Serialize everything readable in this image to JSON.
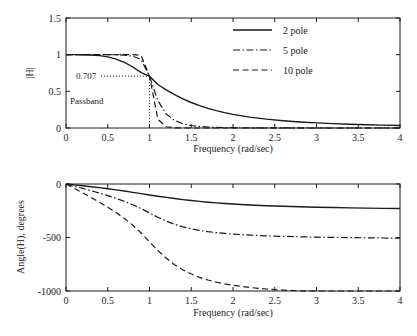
{
  "figure": {
    "background": "#ffffff",
    "ink": "#1a1a1a"
  },
  "legend": {
    "position": "top-right-of-magnitude-plot",
    "entries": [
      {
        "label": "2 pole",
        "style": "solid"
      },
      {
        "label": "5 pole",
        "style": "dash-dot"
      },
      {
        "label": "10 pole",
        "style": "dashed"
      }
    ]
  },
  "annotations": {
    "cutoff_value": "0.707",
    "passband": "Passband"
  },
  "chart_data": [
    {
      "type": "line",
      "title": "",
      "xlabel": "Frequency (rad/sec)",
      "ylabel": "|H|",
      "xlim": [
        0,
        4
      ],
      "ylim": [
        0,
        1.5
      ],
      "xticks": [
        "0",
        "0.5",
        "1",
        "1.5",
        "2",
        "2.5",
        "3",
        "3.5",
        "4"
      ],
      "xtickvals": [
        0,
        0.5,
        1,
        1.5,
        2,
        2.5,
        3,
        3.5,
        4
      ],
      "yticks": [
        "0",
        "0.5",
        "1",
        "1.5"
      ],
      "ytickvals": [
        0,
        0.5,
        1,
        1.5
      ],
      "grid": false,
      "legend_position": "upper right",
      "annotations": [
        {
          "text": "0.707",
          "x": 0.55,
          "y": 0.707,
          "guide": "dotted-horizontal-to-x1"
        },
        {
          "text": "Passband",
          "x": 0.18,
          "y": 0.27
        },
        {
          "guide": "dotted-vertical",
          "x": 1,
          "y0": 0,
          "y1": 0.707
        }
      ],
      "x": [
        0,
        0.1,
        0.2,
        0.3,
        0.4,
        0.5,
        0.6,
        0.7,
        0.8,
        0.9,
        1.0,
        1.1,
        1.2,
        1.3,
        1.4,
        1.5,
        1.6,
        1.7,
        1.8,
        1.9,
        2.0,
        2.2,
        2.4,
        2.6,
        2.8,
        3.0,
        3.2,
        3.4,
        3.6,
        3.8,
        4.0
      ],
      "series": [
        {
          "name": "2 pole",
          "style": "solid",
          "values": [
            1.0,
            0.99995,
            0.9992,
            0.99596,
            0.98744,
            0.9701,
            0.94011,
            0.89433,
            0.8319,
            0.75511,
            0.70711,
            0.59275,
            0.52052,
            0.45507,
            0.39749,
            0.34763,
            0.30477,
            0.26806,
            0.2366,
            0.20959,
            0.1864,
            0.14899,
            0.12083,
            0.09934,
            0.08272,
            0.06969,
            0.05935,
            0.05103,
            0.04428,
            0.03873,
            0.03413
          ]
        },
        {
          "name": "5 pole",
          "style": "dash-dot",
          "values": [
            1.0,
            1.0,
            1.0,
            1.0,
            0.99999,
            0.99984,
            0.99883,
            0.99428,
            0.9777,
            0.93359,
            0.70711,
            0.37419,
            0.19202,
            0.10245,
            0.05753,
            0.03401,
            0.02104,
            0.01354,
            0.009,
            0.00615,
            0.00431,
            0.00226,
            0.00127,
            0.00076,
            0.00047,
            0.00031,
            0.00021,
            0.00014,
            0.0001,
            7e-05,
            5e-05
          ]
        },
        {
          "name": "10 pole",
          "style": "dashed",
          "values": [
            1.0,
            1.0,
            1.0,
            1.0,
            1.0,
            1.0,
            1.0,
            0.99998,
            0.99936,
            0.98942,
            0.70711,
            0.11969,
            0.01717,
            0.00286,
            0.00055,
            0.00012,
            3e-05,
            1e-05,
            0.0,
            0.0,
            0.0,
            0.0,
            0.0,
            0.0,
            0.0,
            0.0,
            0.0,
            0.0,
            0.0,
            0.0,
            0.0
          ]
        }
      ]
    },
    {
      "type": "line",
      "title": "",
      "xlabel": "Frequency (rad/sec)",
      "ylabel": "Angle(H), degrees",
      "xlim": [
        0,
        4
      ],
      "ylim": [
        -1000,
        0
      ],
      "xticks": [
        "0",
        "0.5",
        "1",
        "1.5",
        "2",
        "2.5",
        "3",
        "3.5",
        "4"
      ],
      "xtickvals": [
        0,
        0.5,
        1,
        1.5,
        2,
        2.5,
        3,
        3.5,
        4
      ],
      "yticks": [
        "0",
        "-500",
        "-1000"
      ],
      "ytickvals": [
        0,
        -500,
        -1000
      ],
      "grid": false,
      "x": [
        0,
        0.1,
        0.2,
        0.3,
        0.4,
        0.5,
        0.6,
        0.7,
        0.8,
        0.9,
        1.0,
        1.1,
        1.2,
        1.3,
        1.4,
        1.5,
        1.6,
        1.7,
        1.8,
        1.9,
        2.0,
        2.2,
        2.4,
        2.6,
        2.8,
        3.0,
        3.2,
        3.4,
        3.6,
        3.8,
        4.0
      ],
      "series": [
        {
          "name": "2 pole",
          "style": "solid",
          "values": [
            0,
            -8.1,
            -16.4,
            -25.0,
            -34.2,
            -44.0,
            -54.6,
            -65.9,
            -77.8,
            -90.0,
            -102.2,
            -114.1,
            -125.4,
            -136.0,
            -145.8,
            -154.7,
            -162.7,
            -169.9,
            -176.3,
            -182.1,
            -187.2,
            -195.8,
            -202.7,
            -208.3,
            -212.9,
            -216.8,
            -220.1,
            -222.9,
            -225.3,
            -227.4,
            -229.3
          ]
        },
        {
          "name": "5 pole",
          "style": "dash-dot",
          "values": [
            0,
            -20.6,
            -41.4,
            -62.7,
            -84.9,
            -108.4,
            -133.8,
            -161.9,
            -193.5,
            -229.6,
            -270.0,
            -310.4,
            -346.5,
            -376.5,
            -400.4,
            -419.1,
            -433.7,
            -445.3,
            -454.5,
            -462.0,
            -468.2,
            -477.6,
            -484.4,
            -489.5,
            -493.5,
            -496.6,
            -499.2,
            -501.3,
            -503.1,
            -504.6,
            -505.9
          ]
        },
        {
          "name": "10 pole",
          "style": "dashed",
          "values": [
            0,
            -41.2,
            -82.8,
            -125.4,
            -169.7,
            -216.6,
            -267.2,
            -323.0,
            -386.0,
            -458.0,
            -540.0,
            -621.9,
            -693.9,
            -753.8,
            -802.4,
            -841.4,
            -872.5,
            -897.4,
            -917.5,
            -933.8,
            -947.2,
            -967.3,
            -981.3,
            -991.5,
            -999.1,
            -1004.9,
            -1009.4,
            -1013.0,
            -1016.0,
            -1018.4,
            -1020.4
          ]
        }
      ]
    }
  ]
}
